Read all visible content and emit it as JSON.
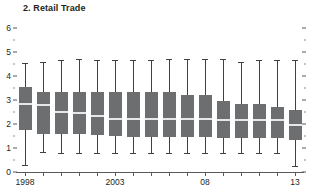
{
  "chart_data": {
    "type": "box",
    "title": "2. Retail Trade",
    "xlabel": "",
    "ylabel": "",
    "ylim": [
      0,
      6
    ],
    "grid": false,
    "legend": null,
    "y_ticks_major": [
      0,
      1,
      2,
      3,
      4,
      5,
      6
    ],
    "y_tick_labels": [
      "0",
      "1",
      "2",
      "3",
      "4",
      "5",
      "6"
    ],
    "y_ticks_minor": [
      0.5,
      1.5,
      2.5,
      3.5,
      4.5,
      5.5
    ],
    "x_tick_labels": [
      {
        "index": 0,
        "label": "1998"
      },
      {
        "index": 5,
        "label": "2003"
      },
      {
        "index": 10,
        "label": "08"
      },
      {
        "index": 15,
        "label": "13"
      }
    ],
    "categories": [
      "1998",
      "1999",
      "2000",
      "2001",
      "2002",
      "2003",
      "2004",
      "2005",
      "2006",
      "2007",
      "08",
      "2009",
      "2010",
      "2011",
      "2012",
      "13"
    ],
    "boxes": [
      {
        "category": "1998",
        "whisker_low": 0.3,
        "q1": 1.75,
        "median": 2.85,
        "q3": 3.55,
        "whisker_high": 4.55
      },
      {
        "category": "1999",
        "whisker_low": 0.85,
        "q1": 1.6,
        "median": 2.8,
        "q3": 3.35,
        "whisker_high": 4.6
      },
      {
        "category": "2000",
        "whisker_low": 0.8,
        "q1": 1.6,
        "median": 2.5,
        "q3": 3.35,
        "whisker_high": 4.65
      },
      {
        "category": "2001",
        "whisker_low": 0.8,
        "q1": 1.6,
        "median": 2.45,
        "q3": 3.35,
        "whisker_high": 4.7
      },
      {
        "category": "2002",
        "whisker_low": 0.8,
        "q1": 1.55,
        "median": 2.35,
        "q3": 3.35,
        "whisker_high": 4.65
      },
      {
        "category": "2003",
        "whisker_low": 0.8,
        "q1": 1.5,
        "median": 2.2,
        "q3": 3.35,
        "whisker_high": 4.65
      },
      {
        "category": "2004",
        "whisker_low": 0.8,
        "q1": 1.45,
        "median": 2.2,
        "q3": 3.35,
        "whisker_high": 4.65
      },
      {
        "category": "2005",
        "whisker_low": 0.8,
        "q1": 1.45,
        "median": 2.2,
        "q3": 3.35,
        "whisker_high": 4.65
      },
      {
        "category": "2006",
        "whisker_low": 0.8,
        "q1": 1.45,
        "median": 2.2,
        "q3": 3.35,
        "whisker_high": 4.7
      },
      {
        "category": "2007",
        "whisker_low": 0.8,
        "q1": 1.45,
        "median": 2.2,
        "q3": 3.2,
        "whisker_high": 4.7
      },
      {
        "category": "08",
        "whisker_low": 0.8,
        "q1": 1.45,
        "median": 2.2,
        "q3": 3.2,
        "whisker_high": 4.7
      },
      {
        "category": "2009",
        "whisker_low": 0.8,
        "q1": 1.4,
        "median": 2.15,
        "q3": 2.95,
        "whisker_high": 4.7
      },
      {
        "category": "2010",
        "whisker_low": 0.8,
        "q1": 1.4,
        "median": 2.15,
        "q3": 2.85,
        "whisker_high": 4.6
      },
      {
        "category": "2011",
        "whisker_low": 0.8,
        "q1": 1.4,
        "median": 2.15,
        "q3": 2.85,
        "whisker_high": 4.65
      },
      {
        "category": "2012",
        "whisker_low": 0.8,
        "q1": 1.4,
        "median": 2.15,
        "q3": 2.7,
        "whisker_high": 4.65
      },
      {
        "category": "13",
        "whisker_low": 0.25,
        "q1": 1.35,
        "median": 1.95,
        "q3": 2.6,
        "whisker_high": 4.65
      }
    ]
  },
  "colors": {
    "box_fill": "#6d6e70",
    "median": "#e6e7e8",
    "whisker": "#404041",
    "axis": "#58595b",
    "text": "#231f20",
    "background": "#ffffff"
  }
}
